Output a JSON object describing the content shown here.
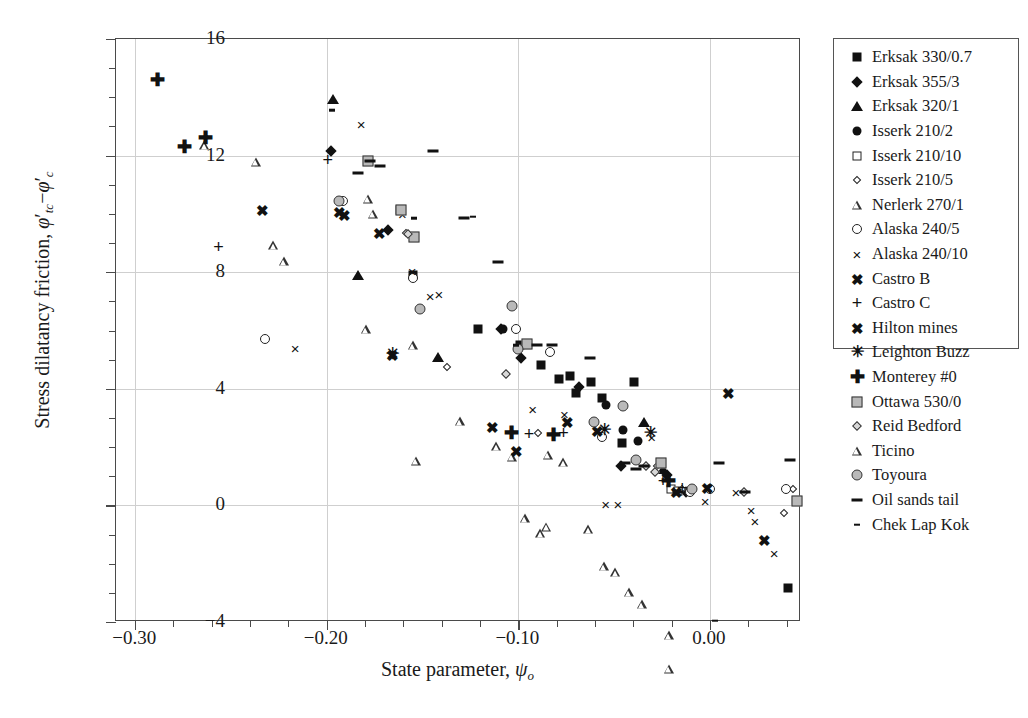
{
  "chart_data": {
    "type": "scatter",
    "title": "",
    "xlabel": "State parameter, ψo",
    "ylabel": "Stress dilatancy friction, ϕ'tc−ϕ'c",
    "xlim": [
      -0.31,
      0.0475
    ],
    "ylim": [
      -4,
      16
    ],
    "xticks": [
      -0.3,
      -0.2,
      -0.1,
      0.0
    ],
    "xticklabels": [
      "−0.30",
      "−0.20",
      "−0.10",
      "0.00"
    ],
    "yticks": [
      -4,
      0,
      4,
      8,
      12,
      16
    ],
    "yticklabels": [
      "−4",
      "0",
      "4",
      "8",
      "12",
      "16"
    ],
    "x_minor_step": 0.02,
    "y_minor_step": 1,
    "grid": "major gridlines at labeled ticks, light gray",
    "legend_position": "right outside",
    "series": [
      {
        "name": "Erksak 330/0.7",
        "marker": "filled-square",
        "points": [
          [
            -0.155,
            7.9
          ],
          [
            -0.121,
            6.05
          ],
          [
            -0.099,
            5.5
          ],
          [
            -0.088,
            4.8
          ],
          [
            -0.079,
            4.35
          ],
          [
            -0.073,
            4.45
          ],
          [
            -0.07,
            3.85
          ],
          [
            -0.062,
            4.25
          ],
          [
            -0.0565,
            3.7
          ],
          [
            -0.046,
            2.15
          ],
          [
            -0.0395,
            4.25
          ],
          [
            0.0405,
            -2.85
          ]
        ]
      },
      {
        "name": "Erksak 355/3",
        "marker": "filled-diamond",
        "points": [
          [
            -0.198,
            12.15
          ],
          [
            -0.168,
            9.45
          ],
          [
            -0.109,
            6.05
          ],
          [
            -0.0985,
            5.05
          ],
          [
            -0.0685,
            4.05
          ],
          [
            -0.0465,
            1.35
          ],
          [
            -0.0225,
            1.05
          ],
          [
            -0.0125,
            0.45
          ]
        ]
      },
      {
        "name": "Erksak 320/1",
        "marker": "filled-triangle",
        "points": [
          [
            -0.1965,
            13.95
          ],
          [
            -0.1835,
            7.9
          ],
          [
            -0.142,
            5.1
          ],
          [
            -0.0345,
            2.85
          ],
          [
            -0.0245,
            1.25
          ]
        ]
      },
      {
        "name": "Isserk 210/2",
        "marker": "filled-circle",
        "points": [
          [
            -0.108,
            6.05
          ],
          [
            -0.0545,
            3.45
          ],
          [
            -0.0455,
            2.6
          ],
          [
            -0.0375,
            2.2
          ]
        ]
      },
      {
        "name": "Isserk 210/10",
        "marker": "open-square",
        "points": [
          [
            -0.162,
            10.15
          ],
          [
            -0.0205,
            0.55
          ],
          [
            -0.0165,
            0.5
          ],
          [
            0.0455,
            0.15
          ]
        ]
      },
      {
        "name": "Isserk 210/5",
        "marker": "small-diamond",
        "points": [
          [
            -0.1585,
            9.35
          ],
          [
            -0.137,
            4.75
          ],
          [
            -0.0895,
            2.5
          ],
          [
            -0.0275,
            1.35
          ],
          [
            -0.0145,
            0.55
          ],
          [
            0.0385,
            -0.25
          ],
          [
            0.0435,
            0.55
          ]
        ]
      },
      {
        "name": "Nerlerk 270/1",
        "marker": "open-triangle",
        "points": [
          [
            -0.264,
            12.35
          ],
          [
            -0.237,
            12.1
          ],
          [
            -0.2225,
            9.0
          ],
          [
            -0.228,
            9.85
          ],
          [
            -0.1785,
            11.75
          ],
          [
            -0.176,
            11.55
          ],
          [
            -0.155,
            7.35
          ],
          [
            -0.1305,
            5.05
          ],
          [
            -0.1115,
            4.5
          ],
          [
            -0.1035,
            4.45
          ],
          [
            -0.0965,
            2.65
          ],
          [
            -0.0885,
            2.45
          ],
          [
            -0.0845,
            5.45
          ],
          [
            -0.0765,
            5.5
          ],
          [
            -0.0635,
            3.5
          ],
          [
            -0.0555,
            2.55
          ],
          [
            -0.0495,
            2.65
          ],
          [
            -0.0215,
            -0.35
          ]
        ]
      },
      {
        "name": "Alaska 240/5",
        "marker": "open-circle",
        "points": [
          [
            -0.232,
            5.7
          ],
          [
            -0.1915,
            10.45
          ],
          [
            -0.155,
            7.8
          ],
          [
            -0.1015,
            6.05
          ],
          [
            -0.0835,
            5.25
          ],
          [
            -0.0565,
            2.35
          ],
          [
            -0.0105,
            0.45
          ],
          [
            0.0,
            0.55
          ],
          [
            0.0395,
            0.55
          ]
        ]
      },
      {
        "name": "Alaska 240/10",
        "marker": "x",
        "points": [
          [
            -0.2165,
            5.4
          ],
          [
            -0.182,
            13.1
          ],
          [
            -0.1605,
            10.0
          ],
          [
            -0.1555,
            8.05
          ],
          [
            -0.146,
            7.2
          ],
          [
            -0.1415,
            7.25
          ],
          [
            -0.0925,
            3.3
          ],
          [
            -0.076,
            3.15
          ],
          [
            -0.0545,
            0.05
          ],
          [
            -0.048,
            0.05
          ],
          [
            -0.0305,
            2.35
          ],
          [
            -0.0025,
            0.15
          ],
          [
            0.0135,
            0.45
          ],
          [
            0.0215,
            -0.15
          ],
          [
            0.0235,
            -0.55
          ],
          [
            0.0335,
            -1.65
          ]
        ]
      },
      {
        "name": "Castro B",
        "marker": "bold-x",
        "points": [
          [
            -0.2335,
            10.15
          ],
          [
            -0.1935,
            10.05
          ],
          [
            -0.1725,
            9.35
          ],
          [
            -0.1135,
            2.7
          ],
          [
            -0.101,
            1.85
          ],
          [
            -0.0585,
            2.55
          ],
          [
            -0.0175,
            0.45
          ],
          [
            0.0095,
            3.85
          ],
          [
            0.0285,
            -1.2
          ]
        ]
      },
      {
        "name": "Castro C",
        "marker": "plus",
        "points": [
          [
            -0.2565,
            8.85
          ],
          [
            -0.1995,
            11.85
          ],
          [
            -0.0945,
            2.45
          ],
          [
            -0.0765,
            2.5
          ],
          [
            -0.0245,
            0.85
          ],
          [
            -0.0145,
            0.6
          ]
        ]
      },
      {
        "name": "Hilton mines",
        "marker": "bold-x",
        "points": [
          [
            -0.1905,
            9.95
          ],
          [
            -0.1655,
            5.15
          ],
          [
            -0.0745,
            2.85
          ],
          [
            -0.0015,
            0.6
          ]
        ]
      },
      {
        "name": "Leighton Buzz",
        "marker": "star",
        "points": [
          [
            -0.1655,
            5.2
          ],
          [
            -0.055,
            2.6
          ],
          [
            -0.031,
            2.5
          ]
        ]
      },
      {
        "name": "Monterey #0",
        "marker": "bold-plus",
        "points": [
          [
            -0.2885,
            14.6
          ],
          [
            -0.274,
            12.3
          ],
          [
            -0.2635,
            12.6
          ],
          [
            -0.1035,
            2.5
          ],
          [
            -0.0815,
            2.4
          ],
          [
            -0.0215,
            0.85
          ]
        ]
      },
      {
        "name": "Ottawa 530/0",
        "marker": "gray-square",
        "points": [
          [
            -0.1785,
            11.8
          ],
          [
            -0.1615,
            10.15
          ],
          [
            -0.1545,
            9.2
          ],
          [
            -0.0955,
            5.55
          ],
          [
            -0.0255,
            1.45
          ],
          [
            0.0455,
            0.15
          ]
        ]
      },
      {
        "name": "Reid Bedford",
        "marker": "gray-diamond",
        "points": [
          [
            -0.1575,
            9.3
          ],
          [
            -0.1065,
            4.5
          ],
          [
            -0.0335,
            1.35
          ],
          [
            -0.0285,
            1.15
          ],
          [
            0.0175,
            0.45
          ]
        ]
      },
      {
        "name": "Ticino",
        "marker": "open-triangle",
        "points": [
          [
            -0.1795,
            11.6
          ],
          [
            -0.1535,
            7.4
          ],
          [
            -0.0855,
            5.45
          ],
          [
            -0.0425,
            3.5
          ],
          [
            -0.0355,
            3.4
          ],
          [
            -0.0215,
            2.65
          ]
        ]
      },
      {
        "name": "Toyoura",
        "marker": "gray-circle",
        "points": [
          [
            -0.1935,
            10.45
          ],
          [
            -0.1515,
            6.75
          ],
          [
            -0.1035,
            6.85
          ],
          [
            -0.1,
            5.35
          ],
          [
            -0.0605,
            2.85
          ],
          [
            -0.0455,
            3.4
          ],
          [
            -0.0385,
            1.55
          ],
          [
            -0.0095,
            0.55
          ]
        ]
      },
      {
        "name": "Oil sands tail",
        "marker": "dash",
        "points": [
          [
            -0.1835,
            11.4
          ],
          [
            -0.1775,
            11.8
          ],
          [
            -0.172,
            11.65
          ],
          [
            -0.1445,
            12.15
          ],
          [
            -0.1285,
            9.85
          ],
          [
            -0.1105,
            8.35
          ],
          [
            -0.0905,
            5.5
          ],
          [
            -0.0825,
            5.5
          ],
          [
            -0.0625,
            5.05
          ],
          [
            -0.0445,
            1.45
          ],
          [
            -0.0385,
            1.25
          ],
          [
            -0.0345,
            1.35
          ],
          [
            -0.0165,
            0.45
          ],
          [
            0.0045,
            1.45
          ],
          [
            0.0185,
            0.45
          ],
          [
            0.0415,
            1.55
          ]
        ]
      },
      {
        "name": "Chek Lap Kok",
        "marker": "small-dash",
        "points": [
          [
            -0.1975,
            13.55
          ],
          [
            -0.1545,
            9.85
          ],
          [
            -0.1235,
            9.9
          ],
          [
            -0.1015,
            5.5
          ],
          [
            0.0025,
            -3.95
          ]
        ]
      }
    ]
  },
  "legend": {
    "items": [
      {
        "label": "Erksak 330/0.7",
        "marker": "filled-square"
      },
      {
        "label": "Erksak 355/3",
        "marker": "filled-diamond"
      },
      {
        "label": "Erksak 320/1",
        "marker": "filled-triangle"
      },
      {
        "label": "Isserk 210/2",
        "marker": "filled-circle"
      },
      {
        "label": "Isserk 210/10",
        "marker": "open-square"
      },
      {
        "label": "Isserk 210/5",
        "marker": "small-diamond"
      },
      {
        "label": "Nerlerk 270/1",
        "marker": "open-triangle"
      },
      {
        "label": "Alaska 240/5",
        "marker": "open-circle"
      },
      {
        "label": "Alaska 240/10",
        "marker": "x"
      },
      {
        "label": "Castro B",
        "marker": "bold-x"
      },
      {
        "label": "Castro C",
        "marker": "plus"
      },
      {
        "label": "Hilton mines",
        "marker": "bold-x"
      },
      {
        "label": "Leighton Buzz",
        "marker": "star"
      },
      {
        "label": "Monterey #0",
        "marker": "bold-plus"
      },
      {
        "label": "Ottawa 530/0",
        "marker": "gray-square"
      },
      {
        "label": "Reid Bedford",
        "marker": "gray-diamond"
      },
      {
        "label": "Ticino",
        "marker": "open-triangle"
      },
      {
        "label": "Toyoura",
        "marker": "gray-circle"
      },
      {
        "label": "Oil sands tail",
        "marker": "dash"
      },
      {
        "label": "Chek Lap Kok",
        "marker": "small-dash"
      }
    ]
  },
  "colors": {
    "frame": "#4a4a4a",
    "grid": "#cfcfcf",
    "marker_fill": "#111111",
    "marker_gray": "#b9b9b9",
    "background": "#ffffff"
  }
}
